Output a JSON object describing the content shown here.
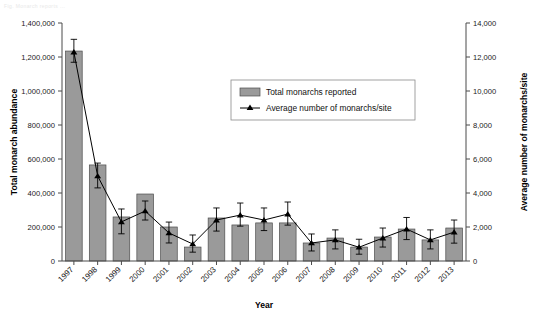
{
  "figure": {
    "top_caption": "Fig.    Monarch reports ..."
  },
  "chart_data": {
    "type": "bar",
    "title": "",
    "xlabel": "Year",
    "ylabel": "Total monarch abundance",
    "y2label": "Average number of monarchs/site",
    "categories": [
      "1997",
      "1998",
      "1999",
      "2000",
      "2001",
      "2002",
      "2003",
      "2004",
      "2005",
      "2006",
      "2007",
      "2008",
      "2009",
      "2010",
      "2011",
      "2012",
      "2013"
    ],
    "ylim": [
      0,
      1400000
    ],
    "y2lim": [
      0,
      14000
    ],
    "yticks": [
      "0",
      "200,000",
      "400,000",
      "600,000",
      "800,000",
      "1,000,000",
      "1,200,000",
      "1,400,000"
    ],
    "ytick_values": [
      0,
      200000,
      400000,
      600000,
      800000,
      1000000,
      1200000,
      1400000
    ],
    "y2ticks": [
      "0",
      "2,000",
      "4,000",
      "6,000",
      "8,000",
      "10,000",
      "12,000",
      "14,000"
    ],
    "y2tick_values": [
      0,
      2000,
      4000,
      6000,
      8000,
      10000,
      12000,
      14000
    ],
    "grid": false,
    "legend_position": "upper-center",
    "series": [
      {
        "name": "Total monarchs reported",
        "type": "bar",
        "axis": "left",
        "color": "#9a9a9a",
        "edge_color": "#4d4d4d",
        "values": [
          1235000,
          565000,
          259000,
          394000,
          200000,
          82000,
          253000,
          212000,
          224000,
          224000,
          106000,
          135000,
          82000,
          141000,
          188000,
          124000,
          194000
        ]
      },
      {
        "name": "Average number of monarchs/site",
        "type": "line",
        "axis": "right",
        "color": "#000000",
        "marker": "triangle",
        "values": [
          12290,
          5000,
          2300,
          2940,
          1650,
          1000,
          2410,
          2700,
          2410,
          2760,
          1060,
          1240,
          810,
          1350,
          1880,
          1240,
          1700
        ],
        "error_low": [
          600,
          700,
          700,
          530,
          590,
          480,
          650,
          650,
          620,
          650,
          470,
          530,
          410,
          530,
          620,
          530,
          650
        ],
        "error_high": [
          750,
          760,
          760,
          590,
          640,
          530,
          710,
          710,
          710,
          710,
          530,
          590,
          470,
          590,
          680,
          590,
          710
        ]
      }
    ]
  },
  "legend": {
    "items": [
      {
        "label": "Total monarchs reported",
        "marker": "bar-swatch"
      },
      {
        "label": "Average number of monarchs/site",
        "marker": "line-triangle"
      }
    ]
  },
  "colors": {
    "bar_fill": "#9a9a9a",
    "bar_edge": "#4d4d4d",
    "line": "#000000",
    "axis": "#4a4a4a",
    "background": "#ffffff"
  }
}
